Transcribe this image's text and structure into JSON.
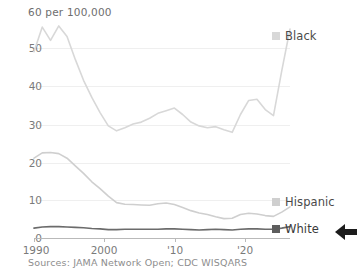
{
  "axis": {
    "unit_label": "60 per 100,000",
    "y_ticks": [
      "50",
      "40",
      "30",
      "20",
      "10",
      "0"
    ],
    "x_ticks": [
      "1990",
      "2000",
      "'10",
      "'20"
    ]
  },
  "legend": {
    "black": {
      "label": "Black",
      "color": "#d8d8d8"
    },
    "hispanic": {
      "label": "Hispanic",
      "color": "#cfcfcf"
    },
    "white": {
      "label": "White",
      "color": "#6b6b6b"
    }
  },
  "source": {
    "text": "Sources: JAMA Network Open; CDC WISQARS"
  },
  "icons": {
    "pointer": "left-arrow-icon"
  },
  "chart_data": {
    "type": "line",
    "title": "",
    "xlabel": "",
    "ylabel": "per 100,000",
    "xlim": [
      1990,
      2021
    ],
    "ylim": [
      0,
      60
    ],
    "grid": true,
    "legend_position": "right",
    "x": [
      1990,
      1991,
      1992,
      1993,
      1994,
      1995,
      1996,
      1997,
      1998,
      1999,
      2000,
      2001,
      2002,
      2003,
      2004,
      2005,
      2006,
      2007,
      2008,
      2009,
      2010,
      2011,
      2012,
      2013,
      2014,
      2015,
      2016,
      2017,
      2018,
      2019,
      2020,
      2021
    ],
    "series": [
      {
        "name": "Black",
        "color": "#d8d8d8",
        "values": [
          49.0,
          55.5,
          52.0,
          55.8,
          53.0,
          47.0,
          41.5,
          37.0,
          33.0,
          29.5,
          28.2,
          29.0,
          30.0,
          30.5,
          31.5,
          32.8,
          33.5,
          34.2,
          32.5,
          30.5,
          29.5,
          29.0,
          29.3,
          28.5,
          27.8,
          32.5,
          36.2,
          36.5,
          33.8,
          32.2,
          44.0,
          55.0
        ]
      },
      {
        "name": "Hispanic",
        "color": "#cfcfcf",
        "values": [
          21.0,
          22.4,
          22.5,
          22.2,
          21.0,
          19.0,
          17.0,
          14.8,
          13.0,
          11.0,
          9.3,
          8.9,
          8.8,
          8.7,
          8.6,
          9.0,
          9.2,
          8.8,
          8.0,
          7.2,
          6.6,
          6.2,
          5.6,
          5.1,
          5.2,
          6.2,
          6.5,
          6.3,
          5.9,
          5.7,
          6.8,
          8.2
        ]
      },
      {
        "name": "White",
        "color": "#6b6b6b",
        "values": [
          2.6,
          2.9,
          3.0,
          3.0,
          2.9,
          2.8,
          2.7,
          2.5,
          2.4,
          2.2,
          2.2,
          2.3,
          2.3,
          2.3,
          2.3,
          2.3,
          2.4,
          2.4,
          2.3,
          2.2,
          2.1,
          2.2,
          2.3,
          2.2,
          2.1,
          2.3,
          2.4,
          2.4,
          2.3,
          2.3,
          2.6,
          3.0
        ]
      }
    ]
  }
}
